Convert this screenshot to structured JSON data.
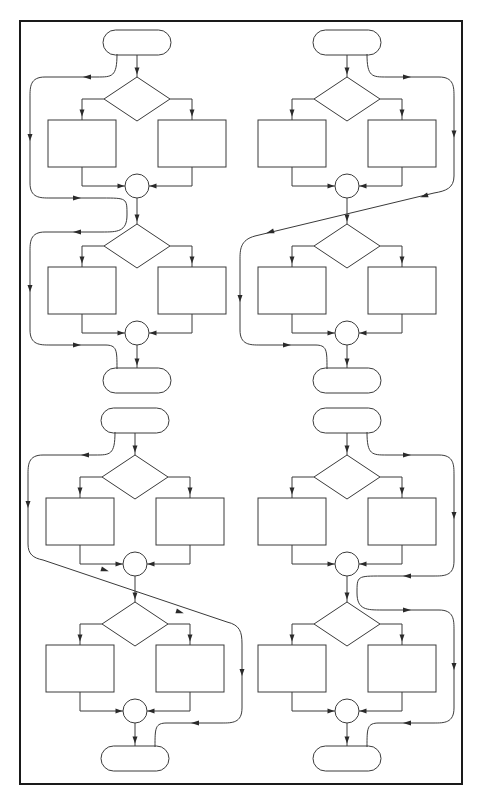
{
  "diagram": {
    "title": "",
    "colors": {
      "line": "#3a3a3a",
      "frame": "#1a1a1a",
      "background": "#ffffff"
    },
    "frame": {
      "x": 20,
      "y": 21,
      "w": 442,
      "h": 763
    },
    "panels": [
      {
        "id": "top-left",
        "cx": 137,
        "top": 30,
        "bypass": "left-s-curve"
      },
      {
        "id": "top-right",
        "cx": 347,
        "top": 30,
        "bypass": "right-then-diagonal-left"
      },
      {
        "id": "bottom-left",
        "cx": 135,
        "top": 408,
        "bypass": "left-then-diagonal-right"
      },
      {
        "id": "bottom-right",
        "cx": 347,
        "top": 408,
        "bypass": "right-s-curve"
      }
    ],
    "labels": []
  }
}
